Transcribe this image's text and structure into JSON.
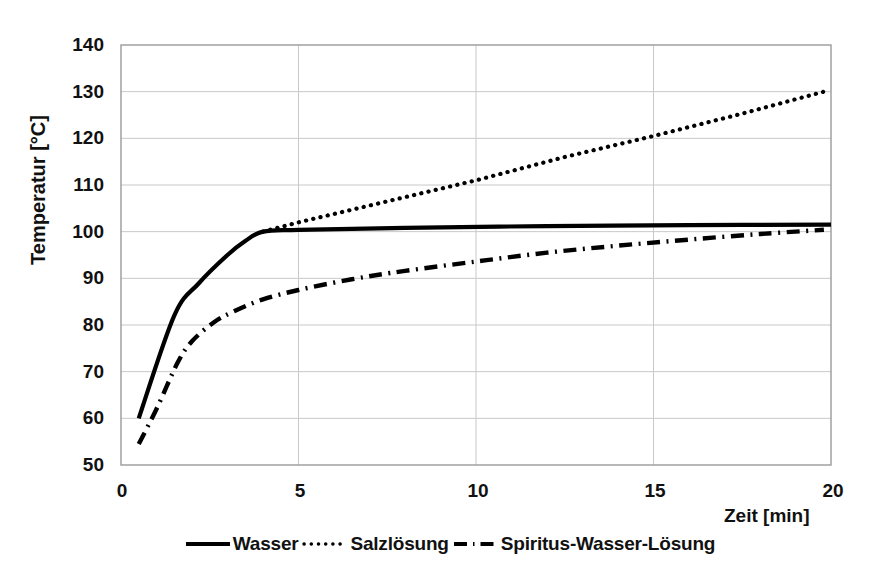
{
  "chart_data": {
    "type": "line",
    "title": "",
    "xlabel": "Zeit [min]",
    "ylabel": "Temperatur [°C]",
    "xlim": [
      0,
      20
    ],
    "ylim": [
      50,
      140
    ],
    "xticks": [
      "0",
      "5",
      "10",
      "15",
      "20"
    ],
    "xtick_values": [
      0,
      5,
      10,
      15,
      20
    ],
    "yticks": [
      "50",
      "60",
      "70",
      "80",
      "90",
      "100",
      "110",
      "120",
      "130",
      "140"
    ],
    "ytick_values": [
      50,
      60,
      70,
      80,
      90,
      100,
      110,
      120,
      130,
      140
    ],
    "grid": true,
    "legend_position": "bottom",
    "series": [
      {
        "name": "Wasser",
        "style": "solid",
        "color": "#000000",
        "points": [
          [
            0.5,
            60.0
          ],
          [
            1.5,
            82.0
          ],
          [
            2.2,
            89.0
          ],
          [
            3.0,
            95.0
          ],
          [
            3.5,
            98.0
          ],
          [
            4.0,
            100.0
          ],
          [
            5.0,
            100.4
          ],
          [
            8.0,
            100.8
          ],
          [
            12.0,
            101.2
          ],
          [
            16.0,
            101.4
          ],
          [
            20.0,
            101.5
          ]
        ]
      },
      {
        "name": "Salzlösung",
        "style": "dotted",
        "color": "#000000",
        "points": [
          [
            4.0,
            100.0
          ],
          [
            5.0,
            102.0
          ],
          [
            7.5,
            106.5
          ],
          [
            10.0,
            111.0
          ],
          [
            12.5,
            116.0
          ],
          [
            15.0,
            120.5
          ],
          [
            17.5,
            125.3
          ],
          [
            19.8,
            130.0
          ]
        ]
      },
      {
        "name": "Spiritus-Wasser-Lösung",
        "style": "dashdot",
        "color": "#000000",
        "points": [
          [
            0.5,
            54.5
          ],
          [
            1.0,
            62.0
          ],
          [
            1.6,
            72.0
          ],
          [
            2.0,
            76.5
          ],
          [
            2.6,
            80.5
          ],
          [
            3.2,
            83.0
          ],
          [
            4.0,
            85.5
          ],
          [
            5.0,
            87.5
          ],
          [
            6.5,
            89.8
          ],
          [
            8.0,
            91.6
          ],
          [
            10.0,
            93.6
          ],
          [
            12.0,
            95.5
          ],
          [
            14.0,
            97.0
          ],
          [
            16.0,
            98.3
          ],
          [
            18.0,
            99.5
          ],
          [
            19.8,
            100.4
          ]
        ]
      }
    ],
    "annotations": []
  },
  "legend": {
    "items": [
      {
        "label": "Wasser",
        "style": "solid"
      },
      {
        "label": "Salzlösung",
        "style": "dotted"
      },
      {
        "label": "Spiritus-Wasser-Lösung",
        "style": "dashdot"
      }
    ]
  },
  "colors": {
    "ink": "#111111",
    "line": "#000000",
    "grid": "#c8c8c8",
    "axis": "#9a9a9a",
    "background": "#ffffff"
  }
}
